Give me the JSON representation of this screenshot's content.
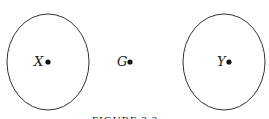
{
  "figure": {
    "caption": "FIGURE 3.3",
    "nodes": [
      {
        "id": "X",
        "label": "X",
        "enclosed": true
      },
      {
        "id": "G",
        "label": "G",
        "enclosed": false
      },
      {
        "id": "Y",
        "label": "Y",
        "enclosed": true
      }
    ],
    "colors": {
      "stroke": "#333333",
      "text": "#222222",
      "background": "#ffffff"
    }
  }
}
